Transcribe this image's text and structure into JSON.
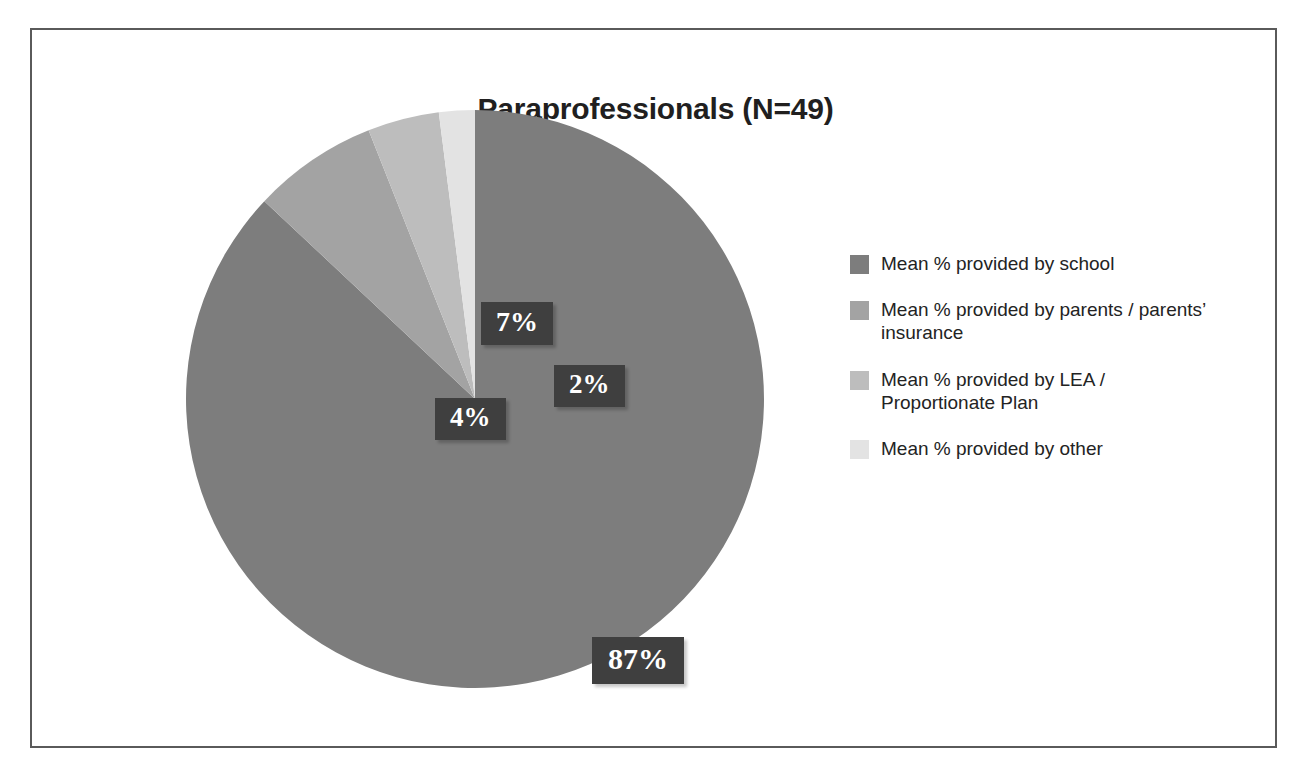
{
  "figure": {
    "background_color": "#ffffff",
    "border_color": "#5a5a5a"
  },
  "chart_data": {
    "type": "pie",
    "title": "Paraprofessionals (N=49)",
    "xlabel": "",
    "ylabel": "",
    "sample_size": 49,
    "categories": [
      "Mean % provided by school",
      "Mean % provided by parents / parents’ insurance",
      "Mean % provided by LEA / Proportionate Plan",
      "Mean % provided by other"
    ],
    "values": [
      87,
      7,
      4,
      2
    ],
    "data_labels": [
      "87%",
      "7%",
      "4%",
      "2%"
    ],
    "colors": [
      "#7d7d7d",
      "#a3a3a3",
      "#bdbdbd",
      "#e3e3e3"
    ],
    "start_angle_deg": 0,
    "direction": "clockwise",
    "legend_position": "right",
    "grid": false
  },
  "title": {
    "text": "Paraprofessionals (N=49)"
  },
  "labels": {
    "school": "87%",
    "parents": "7%",
    "lea": "4%",
    "other": "2%"
  },
  "legend": {
    "items": [
      {
        "label": "Mean % provided by school",
        "color": "#7d7d7d"
      },
      {
        "label": "Mean % provided by parents / parents’ insurance",
        "color": "#a3a3a3"
      },
      {
        "label": "Mean % provided by LEA / Proportionate Plan",
        "color": "#bdbdbd"
      },
      {
        "label": "Mean % provided by other",
        "color": "#e3e3e3"
      }
    ]
  }
}
